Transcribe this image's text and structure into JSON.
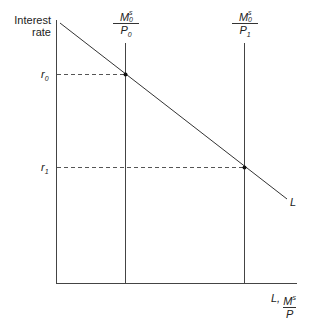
{
  "diagram": {
    "type": "money-market-diagram",
    "y_axis_label_line1": "Interest",
    "y_axis_label_line2": "rate",
    "x_axis_label_prefix": "L, ",
    "x_axis_label_num": "M",
    "x_axis_label_sup": "s",
    "x_axis_label_den": "P",
    "supply0": {
      "num": "M",
      "sup": "s",
      "sub": "0",
      "den": "P",
      "den_sub": "0"
    },
    "supply1": {
      "num": "M",
      "sup": "s",
      "sub": "0",
      "den": "P",
      "den_sub": "1"
    },
    "rate0": {
      "label": "r",
      "sub": "0"
    },
    "rate1": {
      "label": "r",
      "sub": "1"
    },
    "demand_curve_label": "L",
    "colors": {
      "line": "#333333",
      "dashed": "#555555",
      "background": "#ffffff"
    }
  }
}
